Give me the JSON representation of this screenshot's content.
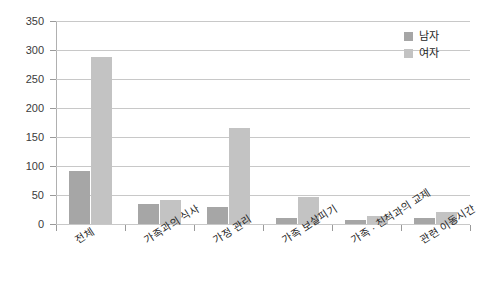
{
  "chart_data": {
    "type": "bar",
    "title": "",
    "subtitle": "",
    "xlabel": "",
    "ylabel": "",
    "ylim": [
      0,
      350
    ],
    "ytick_step": 50,
    "yticks": [
      "350",
      "300",
      "250",
      "200",
      "150",
      "100",
      "50",
      "0"
    ],
    "grid": true,
    "legend_position": "top-right",
    "categories": [
      "전체",
      "가족과의 식사",
      "가정 관리",
      "가족 보살피기",
      "가족 · 친척과의 교제",
      "관련 이동시간"
    ],
    "series": [
      {
        "name": "남자",
        "color": "#a6a6a6",
        "values": [
          92,
          35,
          29,
          10,
          7,
          11
        ]
      },
      {
        "name": "여자",
        "color": "#c3c3c3",
        "values": [
          288,
          42,
          166,
          46,
          14,
          20
        ]
      }
    ]
  },
  "legend": {
    "items": [
      {
        "label": "남자",
        "color": "#a6a6a6"
      },
      {
        "label": "여자",
        "color": "#c3c3c3"
      }
    ]
  },
  "colors": {
    "male": "#a6a6a6",
    "female": "#c3c3c3",
    "gridline": "#c8c8c8",
    "axis": "#b0b0b0",
    "text": "#262626",
    "background": "#ffffff"
  }
}
